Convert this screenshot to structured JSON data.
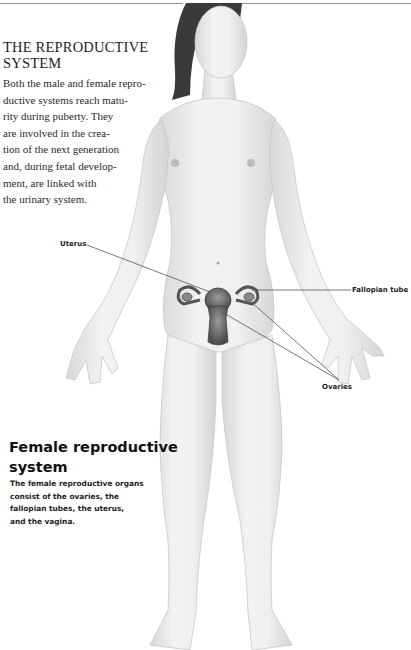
{
  "page": {
    "section_title": "THE REPRODUCTIVE SYSTEM",
    "section_title_lines": [
      "THE REPRODUCTIVE",
      "SYSTEM"
    ],
    "intro_lines": [
      "Both the male and female repro-",
      "ductive systems reach matu-",
      "rity during puberty. They",
      "are involved in the crea-",
      "tion of the next generation",
      "and, during fetal develop-",
      "ment, are linked with",
      "the urinary system."
    ]
  },
  "figure": {
    "labels": {
      "uterus": "Uterus",
      "fallopian_tube": "Fallopian tube",
      "ovaries": "Ovaries"
    }
  },
  "caption": {
    "title_lines": [
      "Female reproductive",
      "system"
    ],
    "body_lines": [
      "The female reproductive organs",
      "consist of the ovaries, the",
      "fallopian tubes, the uterus,",
      "and the vagina."
    ]
  },
  "colors": {
    "rule": "#9a9a9a",
    "skin": "#ececec",
    "skin_shadow": "#d6d6d6",
    "hair": "#3a3a3a",
    "organ": "#6e6e6e",
    "leader_line": "#555555"
  }
}
